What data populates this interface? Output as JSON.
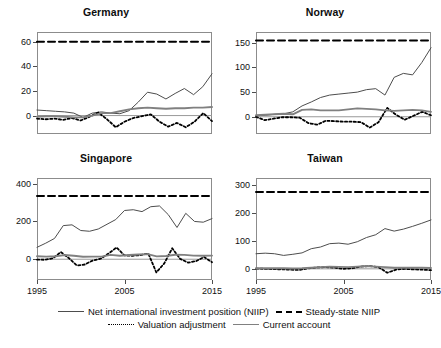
{
  "figure": {
    "panels_layout": "2x2 small multiples",
    "legend": {
      "entries": [
        {
          "label": "Net international investment position (NIIP)",
          "style": "solid-thin",
          "color": "#4d4d4d"
        },
        {
          "label": "Steady-state NIIP",
          "style": "dashed",
          "color": "#000000"
        },
        {
          "label": "Valuation adjustment",
          "style": "dotted",
          "color": "#000000"
        },
        {
          "label": "Current account",
          "style": "solid-thick",
          "color": "#808080"
        }
      ]
    }
  },
  "chart_data": [
    {
      "type": "line",
      "title": "Germany",
      "xlabel": "",
      "ylabel": "",
      "xlim": [
        1995,
        2015
      ],
      "ylim": [
        -15,
        68
      ],
      "xticks": [
        1995,
        2005,
        2015
      ],
      "yticks": [
        0,
        20,
        40,
        60
      ],
      "grid": false,
      "zero_line": 0,
      "x": [
        1995,
        1996,
        1997,
        1998,
        1999,
        2000,
        2001,
        2002,
        2003,
        2004,
        2005,
        2006,
        2007,
        2008,
        2009,
        2010,
        2011,
        2012,
        2013,
        2014
      ],
      "series": [
        {
          "name": "Net international investment position (NIIP)",
          "style": "solid-thin",
          "values": [
            4.5,
            4.0,
            3.5,
            3.0,
            2.0,
            -1.5,
            2.0,
            3.0,
            2.0,
            1.5,
            4.0,
            11.0,
            19.0,
            17.5,
            13.5,
            18.0,
            22.0,
            17.0,
            23.5,
            34.0
          ]
        },
        {
          "name": "Steady-state NIIP",
          "style": "dashed",
          "values": [
            60,
            60,
            60,
            60,
            60,
            60,
            60,
            60,
            60,
            60,
            60,
            60,
            60,
            60,
            60,
            60,
            60,
            60,
            60,
            60
          ]
        },
        {
          "name": "Valuation adjustment",
          "style": "dotted",
          "values": [
            -2.5,
            -3.0,
            -2.5,
            -3.5,
            -2.0,
            -4.0,
            -1.0,
            2.5,
            -3.0,
            -9.5,
            -5.0,
            -2.0,
            -0.5,
            1.0,
            -5.0,
            -9.0,
            -6.0,
            -9.5,
            -5.0,
            2.0,
            -4.5
          ]
        },
        {
          "name": "Current account",
          "style": "solid-thick",
          "values": [
            -1.0,
            -0.5,
            -0.5,
            -1.0,
            -1.5,
            -1.5,
            0.0,
            2.0,
            2.0,
            3.5,
            5.0,
            6.0,
            6.5,
            6.0,
            5.5,
            6.0,
            6.0,
            6.5,
            6.5,
            7.0
          ]
        }
      ]
    },
    {
      "type": "line",
      "title": "Norway",
      "xlabel": "",
      "ylabel": "",
      "xlim": [
        1995,
        2015
      ],
      "ylim": [
        -35,
        172
      ],
      "xticks": [
        1995,
        2005,
        2015
      ],
      "yticks": [
        0,
        50,
        100,
        150
      ],
      "grid": false,
      "zero_line": 0,
      "x": [
        1995,
        1996,
        1997,
        1998,
        1999,
        2000,
        2001,
        2002,
        2003,
        2004,
        2005,
        2006,
        2007,
        2008,
        2009,
        2010,
        2011,
        2012,
        2013,
        2014
      ],
      "series": [
        {
          "name": "Net international investment position (NIIP)",
          "style": "solid-thin",
          "values": [
            2,
            3,
            5,
            6,
            10,
            22,
            30,
            39,
            44,
            46,
            48,
            50,
            55,
            57,
            44,
            80,
            88,
            85,
            110,
            140
          ]
        },
        {
          "name": "Steady-state NIIP",
          "style": "dashed",
          "values": [
            155,
            155,
            155,
            155,
            155,
            155,
            155,
            155,
            155,
            155,
            155,
            155,
            155,
            155,
            155,
            155,
            155,
            155,
            155,
            155
          ]
        },
        {
          "name": "Valuation adjustment",
          "style": "dotted",
          "values": [
            0,
            -7,
            -4,
            -1,
            -1,
            -2,
            -13,
            -16,
            -8,
            -9,
            -10,
            -10,
            -11,
            -22,
            -11,
            18,
            4,
            -6,
            2,
            10,
            3
          ]
        },
        {
          "name": "Current account",
          "style": "solid-thick",
          "values": [
            3,
            4,
            5,
            6,
            5,
            14,
            15,
            13,
            13,
            13,
            15,
            17,
            16,
            15,
            13,
            12,
            13,
            14,
            13,
            10
          ]
        }
      ]
    },
    {
      "type": "line",
      "title": "Singapore",
      "xlabel": "",
      "ylabel": "",
      "xlim": [
        1995,
        2015
      ],
      "ylim": [
        -110,
        430
      ],
      "xticks": [
        1995,
        2005,
        2015
      ],
      "yticks": [
        0,
        200,
        400
      ],
      "grid": false,
      "zero_line": 0,
      "x": [
        1995,
        1996,
        1997,
        1998,
        1999,
        2000,
        2001,
        2002,
        2003,
        2004,
        2005,
        2006,
        2007,
        2008,
        2009,
        2010,
        2011,
        2012,
        2013,
        2014
      ],
      "series": [
        {
          "name": "Net international investment position (NIIP)",
          "style": "solid-thin",
          "values": [
            63,
            85,
            110,
            178,
            182,
            152,
            148,
            160,
            185,
            210,
            258,
            262,
            252,
            278,
            282,
            236,
            168,
            243,
            200,
            196,
            215
          ]
        },
        {
          "name": "Steady-state NIIP",
          "style": "dashed",
          "values": [
            335,
            335,
            335,
            335,
            335,
            335,
            335,
            335,
            335,
            335,
            335,
            335,
            335,
            335,
            335,
            335,
            335,
            335,
            335,
            335
          ]
        },
        {
          "name": "Valuation adjustment",
          "style": "dotted",
          "values": [
            -2,
            -3,
            5,
            38,
            6,
            -33,
            -28,
            -7,
            3,
            30,
            62,
            20,
            18,
            22,
            30,
            -70,
            -22,
            58,
            2,
            -18,
            -10,
            12,
            -16
          ]
        },
        {
          "name": "Current account",
          "style": "solid-thick",
          "values": [
            16,
            14,
            16,
            22,
            18,
            13,
            14,
            14,
            23,
            18,
            22,
            25,
            27,
            15,
            17,
            24,
            23,
            19,
            18,
            19
          ]
        }
      ]
    },
    {
      "type": "line",
      "title": "Taiwan",
      "xlabel": "",
      "ylabel": "",
      "xlim": [
        1995,
        2015
      ],
      "ylim": [
        -40,
        325
      ],
      "xticks": [
        1995,
        2005,
        2015
      ],
      "yticks": [
        0,
        100,
        200,
        300
      ],
      "grid": false,
      "zero_line": 0,
      "x": [
        1995,
        1996,
        1997,
        1998,
        1999,
        2000,
        2001,
        2002,
        2003,
        2004,
        2005,
        2006,
        2007,
        2008,
        2009,
        2010,
        2011,
        2012,
        2013,
        2014
      ],
      "series": [
        {
          "name": "Net international investment position (NIIP)",
          "style": "solid-thin",
          "values": [
            54,
            56,
            54,
            48,
            52,
            57,
            72,
            78,
            90,
            92,
            88,
            97,
            112,
            122,
            144,
            135,
            142,
            152,
            163,
            175
          ]
        },
        {
          "name": "Steady-state NIIP",
          "style": "dashed",
          "values": [
            275,
            275,
            275,
            275,
            275,
            275,
            275,
            275,
            275,
            275,
            275,
            275,
            275,
            275,
            275,
            275,
            275,
            275,
            275,
            275
          ]
        },
        {
          "name": "Valuation adjustment",
          "style": "dotted",
          "values": [
            1,
            0,
            -1,
            -2,
            -3,
            -4,
            2,
            5,
            6,
            4,
            0,
            2,
            8,
            10,
            6,
            -14,
            -3,
            0,
            -2,
            -3,
            -5
          ]
        },
        {
          "name": "Current account",
          "style": "solid-thick",
          "values": [
            2,
            2,
            2,
            2,
            1,
            2,
            4,
            6,
            8,
            7,
            6,
            8,
            10,
            8,
            6,
            4,
            4,
            4,
            4,
            3
          ]
        }
      ]
    }
  ]
}
